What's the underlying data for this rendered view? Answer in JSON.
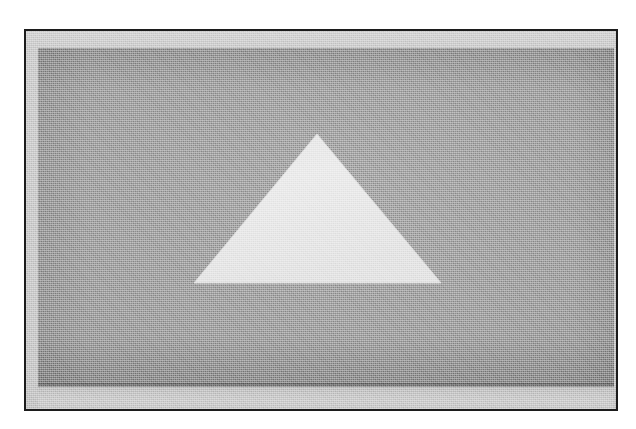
{
  "figure": {
    "kind": "scanned-grayscale-figure",
    "frame": {
      "name": "black-rule-border",
      "stroke_color": "#1c1c1c",
      "stroke_width_px": 2,
      "x": 24,
      "y": 29,
      "width": 594,
      "height": 382
    },
    "page": {
      "background_color": "#ffffff",
      "width": 636,
      "height": 429
    },
    "margin_band": {
      "name": "inner-light-margin",
      "color": "#cbcbcb",
      "top_px": 17,
      "left_px": 14,
      "bottom_px": 26
    },
    "plate": {
      "name": "grey-background-plate",
      "fill_color": "#9a9a9a",
      "highlight_color": "#a3a3a3",
      "edge_color": "#8e8e8e",
      "x": 38,
      "y": 48,
      "width": 576,
      "height": 335,
      "drop_shadow_color": "#6f6f6f",
      "foot_band_color": "#c4c4c4"
    },
    "triangle": {
      "name": "light-triangle",
      "fill_color": "#e8e8e8",
      "edge_color": "#d8d8d8",
      "orientation": "apex-up",
      "apex": {
        "x": 317,
        "y": 134
      },
      "base_left": {
        "x": 194,
        "y": 283
      },
      "base_right": {
        "x": 441,
        "y": 283
      },
      "base_width_px": 247,
      "height_px": 149
    },
    "texture": {
      "name": "halftone-screen",
      "type": "orthogonal-dither",
      "cell_px": 2,
      "strength": 0.42
    }
  },
  "render_notes": {
    "colorspace": "grayscale",
    "tone_levels": [
      "#1c1c1c",
      "#6f6f6f",
      "#8e8e8e",
      "#9a9a9a",
      "#c4c4c4",
      "#cbcbcb",
      "#e8e8e8",
      "#ffffff"
    ]
  }
}
